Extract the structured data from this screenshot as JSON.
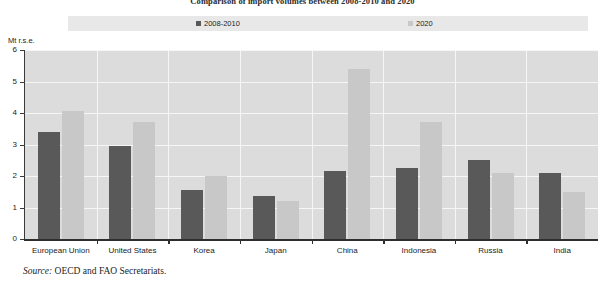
{
  "title": "Comparison of import volumes between 2008-2010 and 2020",
  "source": {
    "label": "Source:",
    "text": "OECD and FAO Secretariats."
  },
  "legend": {
    "position": "top",
    "items": [
      {
        "label": "2008-2010",
        "color": "#595959"
      },
      {
        "label": "2020",
        "color": "#c8c8c8"
      }
    ]
  },
  "colors": {
    "series_1": "#595959",
    "series_2": "#c8c8c8",
    "plot_background": "#dcdcdc",
    "legend_background": "#e8e8e8",
    "gridline": "#f6f6f6",
    "axis": "#2e2e2e"
  },
  "chart_data": {
    "type": "bar",
    "title": "Comparison of import volumes between 2008-2010 and 2020",
    "xlabel": "",
    "ylabel": "Mt r.s.e.",
    "ylim": [
      0,
      6
    ],
    "yticks": [
      0,
      1,
      2,
      3,
      4,
      5,
      6
    ],
    "ytick_labels": [
      "0",
      "1",
      "2",
      "3",
      "4",
      "5",
      "6"
    ],
    "grid": true,
    "legend_position": "top",
    "categories": [
      "European Union",
      "United States",
      "Korea",
      "Japan",
      "China",
      "Indonesia",
      "Russia",
      "India"
    ],
    "series": [
      {
        "name": "2008-2010",
        "color": "#595959",
        "values": [
          3.4,
          2.95,
          1.55,
          1.35,
          2.15,
          2.25,
          2.5,
          2.1
        ]
      },
      {
        "name": "2020",
        "color": "#c8c8c8",
        "values": [
          4.05,
          3.7,
          2.0,
          1.2,
          5.4,
          3.7,
          2.1,
          1.5
        ]
      }
    ]
  }
}
